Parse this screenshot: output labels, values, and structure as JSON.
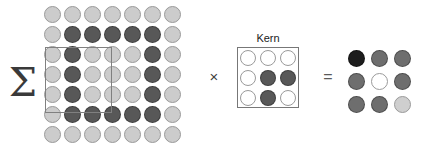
{
  "figure": {
    "background": "#ffffff"
  },
  "operators": {
    "sum": "Σ",
    "sum_name": "summation",
    "multiply": "×",
    "multiply_name": "multiplication",
    "equals": "=",
    "equals_name": "equals"
  },
  "kernel_panel": {
    "label": "Kern",
    "border_color": "#777777"
  },
  "receptive_field": {
    "border_color": "#808080",
    "row_start": 2,
    "col_start": 0,
    "size": 3
  },
  "palette": {
    "light": "#cccccc",
    "lighter": "#d4d4d4",
    "mid": "#9a9a9a",
    "dark": "#585858",
    "darker": "#3f3f3f",
    "black": "#1d1d1d",
    "white": "#ffffff",
    "outline": "#8a8a8a",
    "outline_light": "#b0b0b0"
  },
  "chart_data": {
    "type": "heatmap",
    "xlabel": "",
    "ylabel": "",
    "legend": [],
    "grid": false,
    "input_grid": {
      "name": "input-feature-map",
      "rows": 7,
      "cols": 7,
      "cell_diameter": 17,
      "cell_pitch": 20,
      "values": [
        [
          0,
          0,
          0,
          0,
          0,
          0,
          0
        ],
        [
          0,
          1,
          1,
          1,
          1,
          1,
          0
        ],
        [
          0,
          1,
          0,
          0,
          0,
          1,
          0
        ],
        [
          0,
          1,
          0,
          0,
          0,
          1,
          0
        ],
        [
          0,
          1,
          0,
          0,
          0,
          1,
          0
        ],
        [
          0,
          1,
          1,
          1,
          1,
          1,
          0
        ],
        [
          0,
          0,
          0,
          0,
          0,
          0,
          0
        ]
      ],
      "colors": [
        [
          "#cccccc",
          "#cccccc",
          "#cccccc",
          "#cccccc",
          "#cccccc",
          "#cccccc",
          "#cccccc"
        ],
        [
          "#cccccc",
          "#585858",
          "#585858",
          "#585858",
          "#585858",
          "#585858",
          "#cccccc"
        ],
        [
          "#cccccc",
          "#585858",
          "#cccccc",
          "#cccccc",
          "#cccccc",
          "#585858",
          "#cccccc"
        ],
        [
          "#cccccc",
          "#585858",
          "#cccccc",
          "#cccccc",
          "#cccccc",
          "#585858",
          "#cccccc"
        ],
        [
          "#cccccc",
          "#585858",
          "#cccccc",
          "#cccccc",
          "#cccccc",
          "#585858",
          "#cccccc"
        ],
        [
          "#cccccc",
          "#585858",
          "#585858",
          "#585858",
          "#585858",
          "#585858",
          "#cccccc"
        ],
        [
          "#cccccc",
          "#cccccc",
          "#cccccc",
          "#cccccc",
          "#cccccc",
          "#cccccc",
          "#cccccc"
        ]
      ]
    },
    "kernel_grid": {
      "name": "kernel",
      "label": "Kern",
      "rows": 3,
      "cols": 3,
      "cell_diameter": 16,
      "cell_pitch": 20,
      "values": [
        [
          0,
          0,
          0
        ],
        [
          0,
          1,
          1
        ],
        [
          0,
          1,
          0
        ]
      ],
      "colors": [
        [
          "#ffffff",
          "#ffffff",
          "#ffffff"
        ],
        [
          "#ffffff",
          "#585858",
          "#585858"
        ],
        [
          "#ffffff",
          "#585858",
          "#ffffff"
        ]
      ]
    },
    "output_grid": {
      "name": "output-feature-map",
      "rows": 3,
      "cols": 3,
      "cell_diameter": 17,
      "cell_pitch": 23,
      "values": [
        [
          3,
          2,
          2
        ],
        [
          2,
          0,
          2
        ],
        [
          2,
          2,
          1
        ]
      ],
      "colors": [
        [
          "#1d1d1d",
          "#6e6e6e",
          "#6e6e6e"
        ],
        [
          "#6e6e6e",
          "#ffffff",
          "#6e6e6e"
        ],
        [
          "#6e6e6e",
          "#6e6e6e",
          "#cfcfcf"
        ]
      ]
    }
  }
}
